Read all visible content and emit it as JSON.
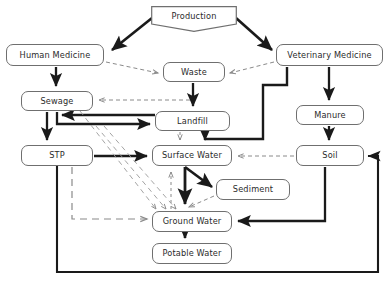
{
  "diagram": {
    "style": {
      "node_border": "#6f6f6f",
      "node_fill": "#ffffff",
      "solid_arrow": "#1a1a1a",
      "dashed_arrow": "#8a8a8a",
      "frame": "#1a1a1a",
      "text": "#2b2b2b"
    },
    "nodes": [
      {
        "id": "production",
        "label": "Production",
        "shape": "pentagon",
        "x": 151,
        "y": 6,
        "w": 86,
        "h": 26
      },
      {
        "id": "human",
        "label": "Human Medicine",
        "shape": "rounded",
        "x": 6,
        "y": 44,
        "w": 98,
        "h": 22
      },
      {
        "id": "veterinary",
        "label": "Veterinary Medicine",
        "shape": "rounded",
        "x": 276,
        "y": 44,
        "w": 107,
        "h": 22
      },
      {
        "id": "waste",
        "label": "Waste",
        "shape": "rounded",
        "x": 163,
        "y": 62,
        "w": 62,
        "h": 20
      },
      {
        "id": "sewage",
        "label": "Sewage",
        "shape": "rounded",
        "x": 21,
        "y": 91,
        "w": 72,
        "h": 20
      },
      {
        "id": "manure",
        "label": "Manure",
        "shape": "rounded",
        "x": 296,
        "y": 105,
        "w": 68,
        "h": 20
      },
      {
        "id": "landfill",
        "label": "Landfill",
        "shape": "rounded",
        "x": 155,
        "y": 111,
        "w": 75,
        "h": 20
      },
      {
        "id": "stp",
        "label": "STP",
        "shape": "rounded",
        "x": 21,
        "y": 145,
        "w": 72,
        "h": 21
      },
      {
        "id": "surfacewater",
        "label": "Surface Water",
        "shape": "rounded",
        "x": 152,
        "y": 145,
        "w": 80,
        "h": 21
      },
      {
        "id": "soil",
        "label": "Soil",
        "shape": "rounded",
        "x": 296,
        "y": 145,
        "w": 68,
        "h": 21
      },
      {
        "id": "sediment",
        "label": "Sediment",
        "shape": "rounded",
        "x": 216,
        "y": 179,
        "w": 74,
        "h": 21
      },
      {
        "id": "groundwater",
        "label": "Ground Water",
        "shape": "rounded",
        "x": 152,
        "y": 211,
        "w": 80,
        "h": 21
      },
      {
        "id": "potablewater",
        "label": "Potable Water",
        "shape": "rounded",
        "x": 152,
        "y": 243,
        "w": 80,
        "h": 21
      }
    ],
    "edges": [
      {
        "from": "production",
        "to": "human",
        "style": "solid"
      },
      {
        "from": "production",
        "to": "veterinary",
        "style": "solid"
      },
      {
        "from": "human",
        "to": "waste",
        "style": "dashed"
      },
      {
        "from": "veterinary",
        "to": "waste",
        "style": "dashed"
      },
      {
        "from": "human",
        "to": "sewage",
        "style": "solid"
      },
      {
        "from": "waste",
        "to": "landfill",
        "style": "solid"
      },
      {
        "from": "veterinary",
        "to": "manure",
        "style": "solid"
      },
      {
        "from": "veterinary",
        "to": "surfacewater",
        "style": "solid"
      },
      {
        "from": "waste",
        "to": "sewage",
        "style": "dashed"
      },
      {
        "from": "landfill",
        "to": "sewage",
        "style": "solid"
      },
      {
        "from": "sewage",
        "to": "landfill",
        "style": "solid"
      },
      {
        "from": "sewage",
        "to": "stp",
        "style": "solid"
      },
      {
        "from": "stp",
        "to": "surfacewater",
        "style": "solid"
      },
      {
        "from": "landfill",
        "to": "surfacewater",
        "style": "dashed"
      },
      {
        "from": "manure",
        "to": "soil",
        "style": "solid"
      },
      {
        "from": "soil",
        "to": "surfacewater",
        "style": "dashed"
      },
      {
        "from": "surfacewater",
        "to": "sediment",
        "style": "solid"
      },
      {
        "from": "sediment",
        "to": "surfacewater",
        "style": "dashed"
      },
      {
        "from": "sediment",
        "to": "groundwater",
        "style": "dashed"
      },
      {
        "from": "surfacewater",
        "to": "groundwater",
        "style": "solid"
      },
      {
        "from": "groundwater",
        "to": "surfacewater",
        "style": "dashed"
      },
      {
        "from": "sewage",
        "to": "groundwater",
        "style": "dashed"
      },
      {
        "from": "stp",
        "to": "groundwater",
        "style": "dashed"
      },
      {
        "from": "soil",
        "to": "groundwater",
        "style": "solid"
      },
      {
        "from": "groundwater",
        "to": "potablewater",
        "style": "solid"
      },
      {
        "from": "stp",
        "to": "soil",
        "style": "solid"
      }
    ]
  }
}
